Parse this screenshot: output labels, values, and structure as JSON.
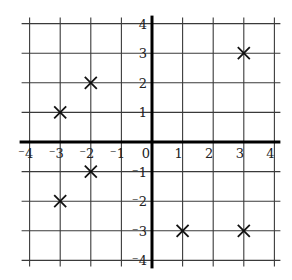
{
  "chart_data": {
    "type": "scatter",
    "title": "",
    "xlabel": "",
    "ylabel": "",
    "xlim": [
      -4,
      4
    ],
    "ylim": [
      -4,
      4
    ],
    "grid": true,
    "marker": "x",
    "x_ticks": [
      -4,
      -3,
      -2,
      -1,
      0,
      1,
      2,
      3,
      4
    ],
    "y_ticks": [
      -4,
      -3,
      -2,
      -1,
      1,
      2,
      3,
      4
    ],
    "x_tick_labels": [
      "⁻4",
      "⁻3",
      "⁻2",
      "⁻1",
      "0",
      "1",
      "2",
      "3",
      "4"
    ],
    "y_tick_labels": [
      "⁻4",
      "⁻3",
      "⁻2",
      "⁻1",
      "1",
      "2",
      "3",
      "4"
    ],
    "points": [
      {
        "x": -3,
        "y": 1
      },
      {
        "x": -2,
        "y": 2
      },
      {
        "x": 3,
        "y": 3
      },
      {
        "x": -2,
        "y": -1
      },
      {
        "x": -3,
        "y": -2
      },
      {
        "x": 1,
        "y": -3
      },
      {
        "x": 3,
        "y": -3
      }
    ]
  },
  "colors": {
    "grid": "#3a3a3a",
    "axis": "#000000",
    "marker": "#111111",
    "background": "#ffffff"
  }
}
